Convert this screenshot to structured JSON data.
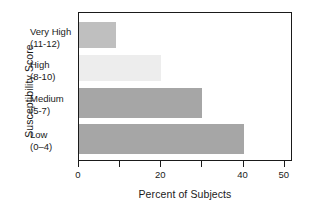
{
  "chart_data": {
    "type": "bar",
    "orientation": "horizontal",
    "title": "",
    "xlabel": "Percent of Subjects",
    "ylabel": "Susceptibility Score",
    "categories": [
      {
        "name": "Very High",
        "range": "(11-12)"
      },
      {
        "name": "High",
        "range": "(8-10)"
      },
      {
        "name": "Medium",
        "range": "(5-7)"
      },
      {
        "name": "Low",
        "range": "(0–4)"
      }
    ],
    "category_labels": [
      "Very High (11-12)",
      "High (8-10)",
      "Medium (5-7)",
      "Low (0–4)"
    ],
    "values": [
      9,
      20,
      30,
      40
    ],
    "bar_colors": [
      "#bfbfbf",
      "#ededed",
      "#a6a6a6",
      "#a6a6a6"
    ],
    "xlim": [
      0,
      52
    ],
    "xticks": [
      0,
      10,
      20,
      30,
      40,
      50
    ],
    "xtick_labels": [
      "0",
      "",
      "20",
      "",
      "40",
      "50"
    ],
    "grid": false,
    "legend": "none",
    "frame_color": "#1a1a1a",
    "background": "#ffffff"
  }
}
